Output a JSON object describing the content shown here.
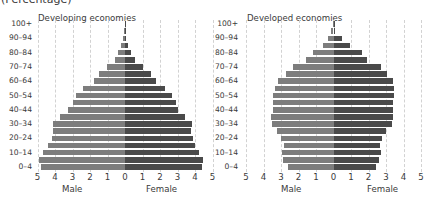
{
  "header": {
    "unit_label": "(Percentage)"
  },
  "colors": {
    "male": "#7d7d7d",
    "female": "#4a4a4a",
    "grid": "#d2d2d2"
  },
  "chart_data": [
    {
      "type": "bar",
      "orientation": "horizontal",
      "subtype": "population-pyramid",
      "title": "Developing economies",
      "xlabel_left": "Male",
      "xlabel_right": "Female",
      "unit": "Percentage",
      "xlim": [
        -5,
        5
      ],
      "x_ticks": [
        "5",
        "4",
        "3",
        "2",
        "1",
        "0",
        "1",
        "2",
        "3",
        "4",
        "5"
      ],
      "grid": true,
      "categories": [
        "0-4",
        "5-9",
        "10-14",
        "15-19",
        "20-24",
        "25-29",
        "30-34",
        "35-39",
        "40-44",
        "45-49",
        "50-54",
        "55-59",
        "60-64",
        "65-69",
        "70-74",
        "75-79",
        "80-84",
        "85-89",
        "90-94",
        "95-99",
        "100+"
      ],
      "y_tick_labels": [
        "0-4",
        "10-14",
        "20-24",
        "30-34",
        "40-44",
        "50-54",
        "60-64",
        "70-74",
        "80-84",
        "90-94",
        "100+"
      ],
      "series": [
        {
          "name": "Male",
          "values": [
            4.8,
            4.9,
            4.7,
            4.4,
            4.2,
            4.1,
            4.1,
            3.7,
            3.25,
            3.0,
            2.8,
            2.4,
            1.8,
            1.5,
            1.05,
            0.6,
            0.4,
            0.25,
            0.1,
            0.03,
            0.01
          ]
        },
        {
          "name": "Female",
          "values": [
            4.4,
            4.45,
            4.25,
            4.0,
            3.9,
            3.75,
            3.8,
            3.4,
            3.0,
            2.9,
            2.7,
            2.3,
            1.75,
            1.5,
            1.0,
            0.55,
            0.35,
            0.15,
            0.05,
            0.03,
            0.01
          ]
        }
      ]
    },
    {
      "type": "bar",
      "orientation": "horizontal",
      "subtype": "population-pyramid",
      "title": "Developed economies",
      "xlabel_left": "Male",
      "xlabel_right": "Female",
      "unit": "Percentage",
      "xlim": [
        -5,
        5
      ],
      "x_ticks": [
        "5",
        "4",
        "3",
        "2",
        "1",
        "0",
        "1",
        "2",
        "3",
        "4",
        "5"
      ],
      "grid": true,
      "categories": [
        "0-4",
        "5-9",
        "10-14",
        "15-19",
        "20-24",
        "25-29",
        "30-34",
        "35-39",
        "40-44",
        "45-49",
        "50-54",
        "55-59",
        "60-64",
        "65-69",
        "70-74",
        "75-79",
        "80-84",
        "85-89",
        "90-94",
        "95-99",
        "100+"
      ],
      "y_tick_labels": [
        "0-4",
        "10-14",
        "20-24",
        "30-34",
        "40-44",
        "50-54",
        "60-64",
        "70-74",
        "80-84",
        "90-94",
        "100+"
      ],
      "series": [
        {
          "name": "Male",
          "values": [
            2.6,
            2.9,
            2.95,
            2.85,
            3.0,
            3.25,
            3.5,
            3.55,
            3.45,
            3.45,
            3.45,
            3.35,
            3.15,
            2.7,
            2.3,
            1.55,
            1.15,
            0.6,
            0.3,
            0.13,
            0.02
          ]
        },
        {
          "name": "Female",
          "values": [
            2.4,
            2.6,
            2.7,
            2.65,
            2.75,
            3.0,
            3.35,
            3.4,
            3.4,
            3.4,
            3.45,
            3.45,
            3.4,
            3.05,
            2.7,
            1.9,
            1.6,
            0.95,
            0.5,
            0.1,
            0.02
          ]
        }
      ]
    }
  ]
}
